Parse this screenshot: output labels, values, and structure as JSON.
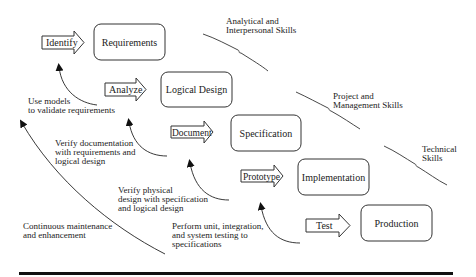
{
  "diagram": {
    "type": "waterfall-sdlc",
    "stages": [
      {
        "action": "Identify",
        "phase": "Requirements"
      },
      {
        "action": "Analyze",
        "phase": "Logical Design"
      },
      {
        "action": "Document",
        "phase": "Specification"
      },
      {
        "action": "Prototype",
        "phase": "Implementation"
      },
      {
        "action": "Test",
        "phase": "Production"
      }
    ],
    "skills": [
      {
        "line1": "Analytical and",
        "line2": "Interpersonal Skills"
      },
      {
        "line1": "Project and",
        "line2": "Management Skills"
      },
      {
        "line1": "Technical",
        "line2": "Skills"
      }
    ],
    "feedback": [
      {
        "lines": [
          "Use models",
          "to validate requirements"
        ]
      },
      {
        "lines": [
          "Verify documentation",
          "with requirements and",
          "logical design"
        ]
      },
      {
        "lines": [
          "Verify physical",
          "design with specification",
          "and logical design"
        ]
      },
      {
        "lines": [
          "Perform unit, integration,",
          "and system testing to",
          "specifications"
        ]
      },
      {
        "lines": [
          "Continuous maintenance",
          "and enhancement"
        ]
      }
    ],
    "colors": {
      "stroke": "#333333",
      "text": "#222222",
      "background": "#ffffff"
    }
  }
}
